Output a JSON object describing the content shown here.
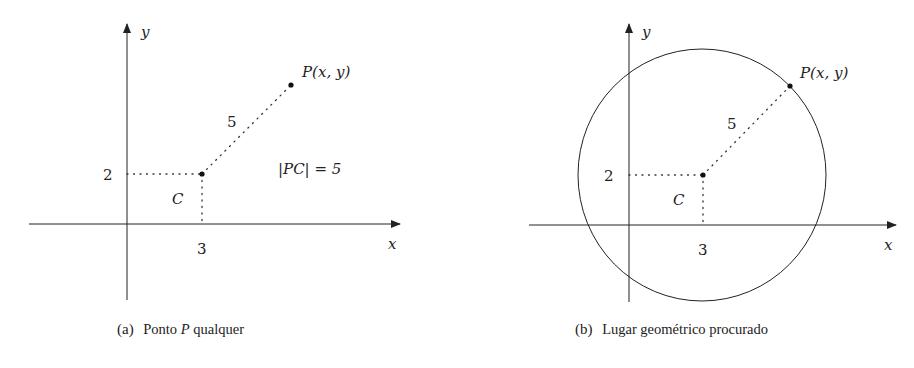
{
  "figure": {
    "panels": [
      {
        "id": "a",
        "caption_tag": "(a)",
        "caption_pre": "Ponto",
        "caption_var": "P",
        "caption_post": "qualquer",
        "axis_x_label": "x",
        "axis_y_label": "y",
        "tick_x": "3",
        "tick_y": "2",
        "center_label": "C",
        "point_label": "P(x, y)",
        "distance_label": "5",
        "relation": "|PC| = 5"
      },
      {
        "id": "b",
        "caption_tag": "(b)",
        "caption_text": "Lugar geométrico procurado",
        "axis_x_label": "x",
        "axis_y_label": "y",
        "tick_x": "3",
        "tick_y": "2",
        "center_label": "C",
        "point_label": "P(x, y)",
        "distance_label": "5"
      }
    ],
    "geometry": {
      "center": [
        3,
        2
      ],
      "radius": 5
    },
    "colors": {
      "ink": "#222222",
      "background": "#ffffff"
    }
  }
}
